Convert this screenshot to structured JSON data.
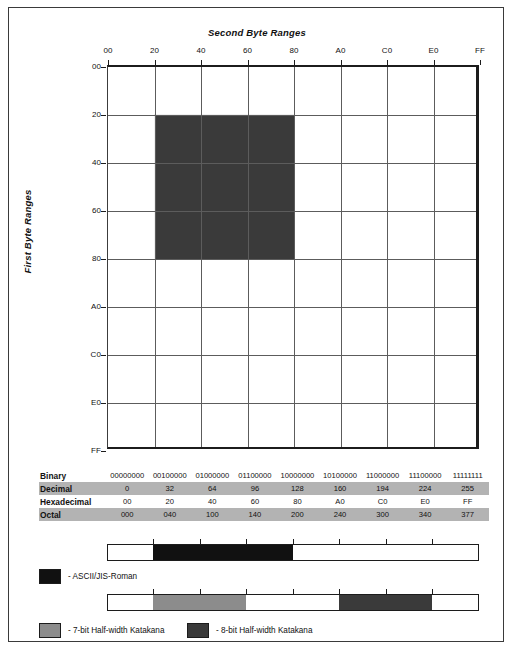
{
  "figure": {
    "chart_title": "Second Byte Ranges",
    "y_axis_title": "First Byte Ranges",
    "caption": ""
  },
  "axes": {
    "x_ticks": [
      "00",
      "20",
      "40",
      "60",
      "80",
      "A0",
      "C0",
      "E0",
      "FF"
    ],
    "y_ticks": [
      "00",
      "20",
      "40",
      "60",
      "80",
      "A0",
      "C0",
      "E0",
      "FF"
    ]
  },
  "colors": {
    "block_fill": "#3a3a3a",
    "ascii_fill": "#111111",
    "katakana_7bit_fill": "#8c8c8c",
    "katakana_8bit_fill": "#3a3a3a",
    "grid_line": "#5c5c5c",
    "axis_line": "#1c1c1c",
    "table_shade": "#b3b3b3"
  },
  "table": {
    "rows": [
      {
        "label": "Binary",
        "shaded": false,
        "values": [
          "00000000",
          "00100000",
          "01000000",
          "01100000",
          "10000000",
          "10100000",
          "11000000",
          "11100000",
          "11111111"
        ]
      },
      {
        "label": "Decimal",
        "shaded": true,
        "values": [
          "0",
          "32",
          "64",
          "96",
          "128",
          "160",
          "194",
          "224",
          "255"
        ]
      },
      {
        "label": "Hexadecimal",
        "shaded": false,
        "values": [
          "00",
          "20",
          "40",
          "60",
          "80",
          "A0",
          "C0",
          "E0",
          "FF"
        ]
      },
      {
        "label": "Octal",
        "shaded": true,
        "values": [
          "000",
          "040",
          "100",
          "140",
          "200",
          "240",
          "300",
          "340",
          "377"
        ]
      }
    ]
  },
  "plot_block": {
    "name": "two-byte-katakana-region",
    "x_start": "20",
    "x_end": "80",
    "y_start": "20",
    "y_end": "80"
  },
  "range_bars": [
    {
      "name": "ascii-jis-roman-bar",
      "segments": [
        {
          "from": "00",
          "to": "20",
          "fill": "none"
        },
        {
          "from": "20",
          "to": "80",
          "fill": "ascii"
        },
        {
          "from": "80",
          "to": "FF",
          "fill": "none"
        }
      ]
    },
    {
      "name": "halfwidth-katakana-bar",
      "segments": [
        {
          "from": "00",
          "to": "20",
          "fill": "none"
        },
        {
          "from": "20",
          "to": "60",
          "fill": "katakana7"
        },
        {
          "from": "60",
          "to": "A0",
          "fill": "none"
        },
        {
          "from": "A0",
          "to": "E0",
          "fill": "katakana8"
        },
        {
          "from": "E0",
          "to": "FF",
          "fill": "none"
        }
      ]
    }
  ],
  "legend": {
    "ascii_label": "- ASCII/JIS-Roman",
    "katakana_7bit_label": "- 7-bit Half-width Katakana",
    "katakana_8bit_label": "- 8-bit Half-width Katakana"
  }
}
